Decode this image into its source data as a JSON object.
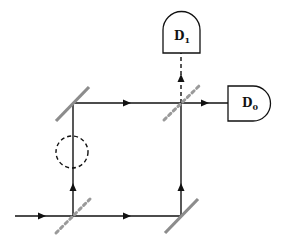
{
  "colors": {
    "beam": "#111111",
    "beam_splitter": "#9a9a9a",
    "mirror": "#8c8c8c",
    "detector_stroke": "#111111",
    "background": "#ffffff"
  },
  "detectors": [
    {
      "id": "D1",
      "label_main": "D",
      "label_sub": "1",
      "position": "top"
    },
    {
      "id": "D0",
      "label_main": "D",
      "label_sub": "0",
      "position": "right"
    }
  ],
  "components": {
    "beam_splitters": [
      "input-beam-splitter",
      "output-beam-splitter"
    ],
    "mirrors": [
      "upper-left-mirror",
      "lower-right-mirror"
    ],
    "obstacle": "dashed-circle"
  }
}
